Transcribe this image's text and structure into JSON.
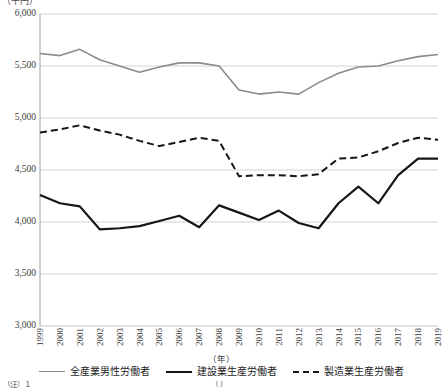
{
  "chart_data": {
    "type": "line",
    "title": "",
    "unit_label": "（千円）",
    "xlabel": "（年）",
    "ylabel": "",
    "grid": true,
    "legend_position": "bottom",
    "ylim": [
      3000,
      6000
    ],
    "ytick_step": 500,
    "ytick_labels": [
      "6,000",
      "5,500",
      "5,000",
      "4,500",
      "4,000",
      "3,500",
      "3,000"
    ],
    "ytick_values": [
      6000,
      5500,
      5000,
      4500,
      4000,
      3500,
      3000
    ],
    "categories": [
      "1999",
      "2000",
      "2001",
      "2002",
      "2003",
      "2004",
      "2005",
      "2006",
      "2007",
      "2008",
      "2009",
      "2010",
      "2011",
      "2012",
      "2013",
      "2014",
      "2015",
      "2016",
      "2017",
      "2018",
      "2019"
    ],
    "x": [
      1999,
      2000,
      2001,
      2002,
      2003,
      2004,
      2005,
      2006,
      2007,
      2008,
      2009,
      2010,
      2011,
      2012,
      2013,
      2014,
      2015,
      2016,
      2017,
      2018,
      2019
    ],
    "series": [
      {
        "name": "全産業男性労働者",
        "style": "solid",
        "color": "#8b8b8b",
        "width": 1.6,
        "values": [
          5620,
          5600,
          5660,
          5560,
          5500,
          5440,
          5490,
          5530,
          5530,
          5500,
          5270,
          5230,
          5250,
          5230,
          5340,
          5430,
          5490,
          5500,
          5550,
          5590,
          5610
        ]
      },
      {
        "name": "建設業生産労働者",
        "style": "solid",
        "color": "#161616",
        "width": 2.2,
        "values": [
          4260,
          4180,
          4150,
          3930,
          3940,
          3960,
          4010,
          4060,
          3950,
          4160,
          4090,
          4020,
          4110,
          3990,
          3940,
          4180,
          4340,
          4180,
          4450,
          4610,
          4610
        ]
      },
      {
        "name": "製造業生産労働者",
        "style": "dashed",
        "color": "#161616",
        "width": 2.0,
        "values": [
          4860,
          4890,
          4930,
          4880,
          4840,
          4780,
          4730,
          4770,
          4810,
          4780,
          4440,
          4450,
          4450,
          4440,
          4460,
          4610,
          4620,
          4680,
          4760,
          4810,
          4790
        ]
      }
    ]
  },
  "legend": {
    "entries": [
      {
        "label": "全産業男性労働者",
        "swatch": "solid-gray"
      },
      {
        "label": "建設業生産労働者",
        "swatch": "solid-black"
      },
      {
        "label": "製造業生産労働者",
        "swatch": "dashed-black"
      }
    ]
  },
  "source_note": "（注）１ 　　　　　　　　　　　　　　　　　　　　　　　　　　（ ）"
}
